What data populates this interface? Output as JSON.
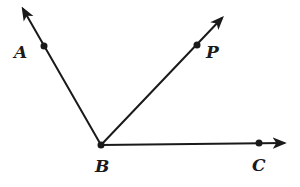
{
  "diagram": {
    "type": "geometry-angle",
    "vertex": {
      "label": "B"
    },
    "rays": [
      {
        "name": "ray-BA",
        "through": "A",
        "arrow": true
      },
      {
        "name": "ray-BP",
        "through": "P",
        "arrow": true
      },
      {
        "name": "ray-BC",
        "through": "C",
        "arrow": true
      }
    ],
    "points": [
      {
        "label": "A"
      },
      {
        "label": "P"
      },
      {
        "label": "B"
      },
      {
        "label": "C"
      }
    ],
    "colors": {
      "ink": "#1a1a1a",
      "background": "#ffffff"
    }
  }
}
